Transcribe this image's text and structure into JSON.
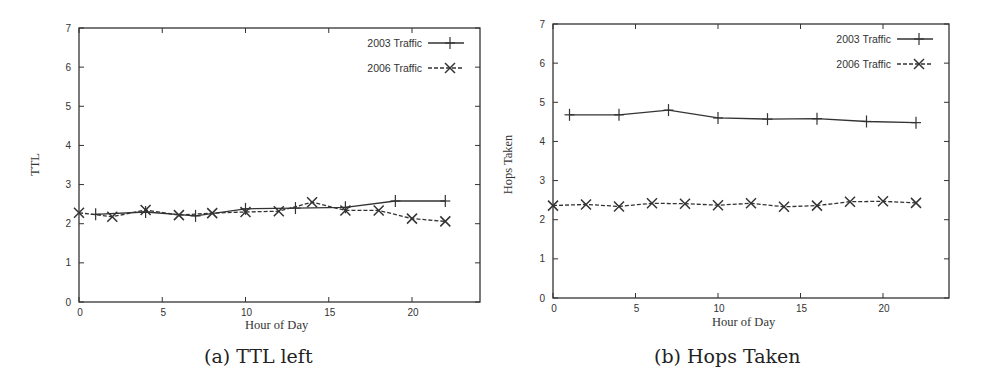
{
  "chart_data": [
    {
      "type": "line",
      "panel_id": "a",
      "title": "(a) TTL left",
      "xlabel": "Hour of Day",
      "ylabel": "TTL",
      "xlim": [
        0,
        24
      ],
      "ylim": [
        0,
        7
      ],
      "xticks": [
        0,
        5,
        10,
        15,
        20
      ],
      "yticks": [
        0,
        1,
        2,
        3,
        4,
        5,
        6,
        7
      ],
      "grid": false,
      "legend_position": "top-right",
      "series": [
        {
          "name": "2003 Traffic",
          "style": "solid",
          "marker": "plus",
          "x": [
            1,
            4,
            7,
            10,
            13,
            16,
            19,
            22
          ],
          "values": [
            2.24,
            2.3,
            2.2,
            2.38,
            2.4,
            2.42,
            2.58,
            2.58
          ]
        },
        {
          "name": "2006 Traffic",
          "style": "dashed",
          "marker": "cross",
          "x": [
            0,
            2,
            4,
            6,
            8,
            10,
            12,
            14,
            16,
            18,
            20,
            22
          ],
          "values": [
            2.28,
            2.18,
            2.35,
            2.22,
            2.27,
            2.3,
            2.32,
            2.55,
            2.34,
            2.34,
            2.13,
            2.06
          ]
        }
      ]
    },
    {
      "type": "line",
      "panel_id": "b",
      "title": "(b) Hops Taken",
      "xlabel": "Hour of Day",
      "ylabel": "Hops Taken",
      "xlim": [
        0,
        24
      ],
      "ylim": [
        0,
        7
      ],
      "xticks": [
        0,
        5,
        10,
        15,
        20
      ],
      "yticks": [
        0,
        1,
        2,
        3,
        4,
        5,
        6,
        7
      ],
      "grid": false,
      "legend_position": "top-right",
      "series": [
        {
          "name": "2003 Traffic",
          "style": "solid",
          "marker": "plus",
          "x": [
            1,
            4,
            7,
            10,
            13,
            16,
            19,
            22
          ],
          "values": [
            4.68,
            4.68,
            4.8,
            4.6,
            4.57,
            4.58,
            4.51,
            4.48
          ]
        },
        {
          "name": "2006 Traffic",
          "style": "dashed",
          "marker": "cross",
          "x": [
            0,
            2,
            4,
            6,
            8,
            10,
            12,
            14,
            16,
            18,
            20,
            22
          ],
          "values": [
            2.36,
            2.39,
            2.34,
            2.42,
            2.41,
            2.37,
            2.42,
            2.33,
            2.36,
            2.46,
            2.47,
            2.43
          ]
        }
      ]
    }
  ],
  "layout": {
    "panels": [
      {
        "left": 79,
        "top": 28,
        "right": 480,
        "bottom": 302,
        "x_per_unit": 16.65
      },
      {
        "left": 553,
        "top": 24,
        "right": 949,
        "bottom": 298,
        "x_per_unit": 16.5
      }
    ],
    "line_color": "#333333"
  }
}
